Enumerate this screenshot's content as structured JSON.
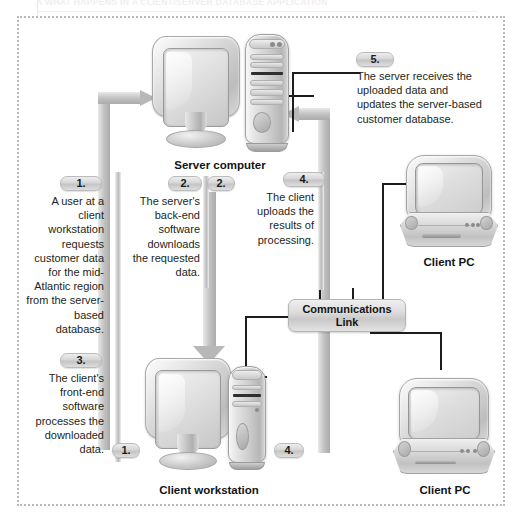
{
  "figure": {
    "top_caption": "A WHAT HAPPENS IN A CLIENT/SERVER DATABASE APPLICATION",
    "steps": [
      {
        "id": "step-1",
        "number": "1.",
        "text": "A user at a client workstation requests customer data for the mid-Atlantic region from the server-based database."
      },
      {
        "id": "step-2",
        "number": "2.",
        "text": "The server's back-end software downloads the requested data."
      },
      {
        "id": "step-3",
        "number": "3.",
        "text": "The client's front-end software processes the downloaded data."
      },
      {
        "id": "step-4",
        "number": "4.",
        "text": "The client uploads the results of processing."
      },
      {
        "id": "step-5",
        "number": "5.",
        "text": "The server receives the uploaded data and updates the server-based customer database."
      }
    ],
    "arrow_markers": {
      "server_in_top": "2.",
      "server_in_right": "4.",
      "workstation_out": "1.",
      "workstation_in": "4."
    },
    "devices": [
      {
        "id": "server-computer",
        "label": "Server computer"
      },
      {
        "id": "client-workstation",
        "label": "Client workstation"
      },
      {
        "id": "client-pc-top",
        "label": "Client PC"
      },
      {
        "id": "client-pc-bottom",
        "label": "Client PC"
      }
    ],
    "network": {
      "link_line1": "Communications",
      "link_line2": "Link"
    },
    "colors": {
      "background": "#ffffff",
      "frame_dotted": "#b9b9bd",
      "text": "#231f20",
      "pipe_arrow": "#c3c3c3",
      "wire": "#1c1c1c",
      "pill_face": "#d6d6d6"
    }
  }
}
